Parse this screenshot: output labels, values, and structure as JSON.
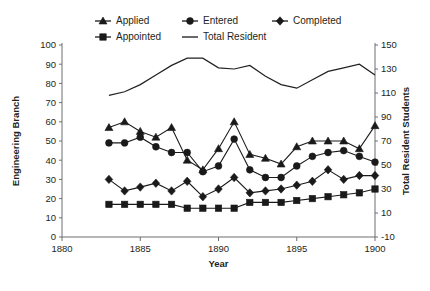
{
  "chart_data": {
    "type": "line",
    "title": "",
    "xlabel": "Year",
    "ylabel": "Engineering Branch",
    "y2label": "Total Resident Students",
    "x": [
      1883,
      1884,
      1885,
      1886,
      1887,
      1888,
      1889,
      1890,
      1891,
      1892,
      1893,
      1894,
      1895,
      1896,
      1897,
      1898,
      1899,
      1900
    ],
    "xlim": [
      1880,
      1900
    ],
    "xticks": [
      1880,
      1885,
      1890,
      1895,
      1900
    ],
    "xtick_labels": [
      "1880",
      "1885",
      "1890",
      "1895",
      "1900"
    ],
    "ylim": [
      0,
      100
    ],
    "yticks": [
      0,
      10,
      20,
      30,
      40,
      50,
      60,
      70,
      80,
      90,
      100
    ],
    "ytick_labels": [
      "0",
      "10",
      "20",
      "30",
      "40",
      "50",
      "60",
      "70",
      "80",
      "90",
      "100"
    ],
    "y2lim": [
      -10,
      150
    ],
    "y2ticks": [
      -10,
      10,
      30,
      50,
      70,
      90,
      110,
      130,
      150
    ],
    "y2tick_labels": [
      "-10",
      "10",
      "30",
      "50",
      "70",
      "90",
      "110",
      "130",
      "150"
    ],
    "grid": false,
    "legend_position": "top",
    "series": [
      {
        "name": "Applied",
        "marker": "triangle",
        "axis": "left",
        "values": [
          57,
          60,
          55,
          52,
          57,
          40,
          35,
          46,
          60,
          43,
          41,
          38,
          47,
          50,
          50,
          50,
          46,
          58
        ]
      },
      {
        "name": "Entered",
        "marker": "circle",
        "axis": "left",
        "values": [
          49,
          49,
          52,
          47,
          44,
          44,
          34,
          37,
          51,
          35,
          31,
          31,
          37,
          42,
          44,
          45,
          42,
          39
        ]
      },
      {
        "name": "Completed",
        "marker": "diamond",
        "axis": "left",
        "values": [
          30,
          24,
          26,
          28,
          24,
          29,
          21,
          25,
          31,
          23,
          24,
          25,
          27,
          29,
          35,
          30,
          32,
          32
        ]
      },
      {
        "name": "Appointed",
        "marker": "square",
        "axis": "left",
        "values": [
          17,
          17,
          17,
          17,
          17,
          15,
          15,
          15,
          15,
          18,
          18,
          18,
          19,
          20,
          21,
          22,
          23,
          25
        ]
      },
      {
        "name": "Total Resident",
        "marker": "none",
        "axis": "right",
        "values": [
          108,
          111,
          117,
          125,
          133,
          139,
          139,
          131,
          130,
          133,
          124,
          117,
          114,
          121,
          128,
          131,
          134,
          125
        ]
      }
    ]
  },
  "legend": {
    "items": [
      {
        "label": "Applied",
        "marker": "triangle"
      },
      {
        "label": "Entered",
        "marker": "circle"
      },
      {
        "label": "Completed",
        "marker": "diamond"
      },
      {
        "label": "Appointed",
        "marker": "square"
      },
      {
        "label": "Total Resident",
        "marker": "line"
      }
    ]
  },
  "axes": {
    "x_title": "Year",
    "y_title": "Engineering Branch",
    "y2_title": "Total Resident Students"
  },
  "colors": {
    "ink": "#1a1a1a",
    "axis": "#6d6e71",
    "background": "#ffffff"
  }
}
